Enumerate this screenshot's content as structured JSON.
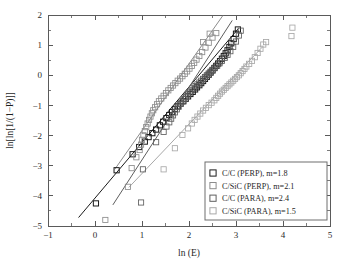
{
  "figure": {
    "background_color": "#ffffff",
    "axis_color": "#5a5a5a"
  },
  "chart_data": {
    "type": "scatter",
    "title": "",
    "xlabel": "ln (E)",
    "ylabel": "ln[ln[1/(1−P)]]",
    "xlim": [
      -1,
      5
    ],
    "ylim": [
      -5,
      2
    ],
    "xticks": [
      -1,
      0,
      1,
      2,
      3,
      4,
      5
    ],
    "xtick_labels": [
      "−1",
      "0",
      "1",
      "2",
      "3",
      "4",
      "5"
    ],
    "yticks": [
      -5,
      -4,
      -3,
      -2,
      -1,
      0,
      1,
      2
    ],
    "ytick_labels": [
      "−5",
      "−4",
      "−3",
      "−2",
      "−1",
      "0",
      "1",
      "2"
    ],
    "xminor_step": 0.5,
    "yminor_step": 0.5,
    "grid": false,
    "legend_position": "lower right",
    "marker_shape": "open-square",
    "series": [
      {
        "name": "C/C (PERP)",
        "legend_label": "C/C (PERP), m=1.8",
        "weibull_modulus": 1.8,
        "color": "#1a1a1a",
        "fit_line": {
          "x": [
            -0.35,
            3.05
          ],
          "y": [
            -4.72,
            1.55
          ],
          "slope": 1.844,
          "intercept": -4.074
        },
        "points": [
          [
            0.02,
            -4.25
          ],
          [
            0.46,
            -3.15
          ],
          [
            0.8,
            -2.62
          ],
          [
            0.94,
            -2.38
          ],
          [
            1.06,
            -2.2
          ],
          [
            1.14,
            -2.05
          ],
          [
            1.22,
            -1.92
          ],
          [
            1.3,
            -1.8
          ],
          [
            1.38,
            -1.66
          ],
          [
            1.45,
            -1.54
          ],
          [
            1.52,
            -1.42
          ],
          [
            1.58,
            -1.32
          ],
          [
            1.64,
            -1.22
          ],
          [
            1.7,
            -1.12
          ],
          [
            1.76,
            -1.03
          ],
          [
            1.82,
            -0.94
          ],
          [
            1.88,
            -0.86
          ],
          [
            1.93,
            -0.78
          ],
          [
            1.98,
            -0.7
          ],
          [
            2.03,
            -0.62
          ],
          [
            2.08,
            -0.55
          ],
          [
            2.13,
            -0.47
          ],
          [
            2.17,
            -0.4
          ],
          [
            2.22,
            -0.33
          ],
          [
            2.26,
            -0.26
          ],
          [
            2.3,
            -0.19
          ],
          [
            2.34,
            -0.12
          ],
          [
            2.38,
            -0.05
          ],
          [
            2.42,
            0.02
          ],
          [
            2.46,
            0.09
          ],
          [
            2.5,
            0.16
          ],
          [
            2.54,
            0.24
          ],
          [
            2.58,
            0.31
          ],
          [
            2.62,
            0.39
          ],
          [
            2.66,
            0.47
          ],
          [
            2.7,
            0.55
          ],
          [
            2.74,
            0.64
          ],
          [
            2.78,
            0.73
          ],
          [
            2.82,
            0.83
          ],
          [
            2.86,
            0.94
          ],
          [
            2.9,
            1.06
          ],
          [
            2.95,
            1.2
          ],
          [
            3.0,
            1.38
          ],
          [
            3.04,
            1.52
          ]
        ]
      },
      {
        "name": "C/SiC (PERP)",
        "legend_label": "C/SiC (PERP), m=2.1",
        "weibull_modulus": 2.1,
        "color": "#8c8c8c",
        "fit_line": {
          "x": [
            0.42,
            2.72
          ],
          "y": [
            -3.12,
            1.98
          ],
          "slope": 2.217,
          "intercept": -4.051
        },
        "points": [
          [
            0.22,
            -4.8
          ],
          [
            0.7,
            -3.7
          ],
          [
            0.78,
            -3.08
          ],
          [
            0.88,
            -2.72
          ],
          [
            0.95,
            -2.48
          ],
          [
            0.98,
            -2.3
          ],
          [
            1.0,
            -2.14
          ],
          [
            1.03,
            -1.99
          ],
          [
            1.06,
            -1.85
          ],
          [
            1.09,
            -1.72
          ],
          [
            1.12,
            -1.6
          ],
          [
            1.15,
            -1.48
          ],
          [
            1.18,
            -1.37
          ],
          [
            1.21,
            -1.26
          ],
          [
            1.24,
            -1.16
          ],
          [
            1.28,
            -1.06
          ],
          [
            1.32,
            -0.96
          ],
          [
            1.36,
            -0.86
          ],
          [
            1.41,
            -0.77
          ],
          [
            1.46,
            -0.68
          ],
          [
            1.51,
            -0.59
          ],
          [
            1.56,
            -0.5
          ],
          [
            1.61,
            -0.42
          ],
          [
            1.66,
            -0.34
          ],
          [
            1.71,
            -0.26
          ],
          [
            1.76,
            -0.18
          ],
          [
            1.81,
            -0.11
          ],
          [
            1.86,
            -0.03
          ],
          [
            1.91,
            0.05
          ],
          [
            1.96,
            0.13
          ],
          [
            2.01,
            0.22
          ],
          [
            2.06,
            0.31
          ],
          [
            2.11,
            0.41
          ],
          [
            2.16,
            0.52
          ],
          [
            2.22,
            0.64
          ],
          [
            2.28,
            0.77
          ],
          [
            2.35,
            0.92
          ],
          [
            2.42,
            1.08
          ],
          [
            2.5,
            1.25
          ],
          [
            2.58,
            1.4
          ],
          [
            2.44,
            1.38
          ],
          [
            2.3,
            1.1
          ]
        ]
      },
      {
        "name": "C/C (PARA)",
        "legend_label": "C/C (PARA), m=2.4",
        "weibull_modulus": 2.4,
        "color": "#5e5e5e",
        "fit_line": {
          "x": [
            0.38,
            2.92
          ],
          "y": [
            -4.3,
            1.82
          ],
          "slope": 2.409,
          "intercept": -5.216
        },
        "points": [
          [
            0.98,
            -4.22
          ],
          [
            1.02,
            -3.12
          ],
          [
            1.3,
            -2.22
          ],
          [
            1.46,
            -1.88
          ],
          [
            1.52,
            -1.7
          ],
          [
            1.58,
            -1.56
          ],
          [
            1.62,
            -1.44
          ],
          [
            1.66,
            -1.33
          ],
          [
            1.7,
            -1.23
          ],
          [
            1.74,
            -1.13
          ],
          [
            1.78,
            -1.04
          ],
          [
            1.82,
            -0.95
          ],
          [
            1.86,
            -0.87
          ],
          [
            1.9,
            -0.79
          ],
          [
            1.94,
            -0.71
          ],
          [
            1.98,
            -0.64
          ],
          [
            2.02,
            -0.57
          ],
          [
            2.06,
            -0.5
          ],
          [
            2.1,
            -0.43
          ],
          [
            2.14,
            -0.36
          ],
          [
            2.18,
            -0.3
          ],
          [
            2.22,
            -0.24
          ],
          [
            2.26,
            -0.18
          ],
          [
            2.3,
            -0.12
          ],
          [
            2.34,
            -0.06
          ],
          [
            2.38,
            0.0
          ],
          [
            2.42,
            0.06
          ],
          [
            2.46,
            0.12
          ],
          [
            2.5,
            0.18
          ],
          [
            2.55,
            0.25
          ],
          [
            2.6,
            0.32
          ],
          [
            2.65,
            0.4
          ],
          [
            2.7,
            0.48
          ],
          [
            2.76,
            0.58
          ],
          [
            2.82,
            0.68
          ],
          [
            2.88,
            0.8
          ],
          [
            2.94,
            0.94
          ],
          [
            3.0,
            1.12
          ],
          [
            3.06,
            1.32
          ],
          [
            3.1,
            1.48
          ]
        ]
      },
      {
        "name": "C/SiC (PARA)",
        "legend_label": "C/SiC (PARA), m=1.5",
        "weibull_modulus": 1.5,
        "color": "#a8a8a8",
        "fit_line": {
          "x": [
            0.72,
            3.55
          ],
          "y": [
            -3.72,
            0.92
          ],
          "slope": 1.64,
          "intercept": -4.901
        },
        "points": [
          [
            1.46,
            -3.12
          ],
          [
            1.7,
            -2.42
          ],
          [
            1.86,
            -1.98
          ],
          [
            1.98,
            -1.76
          ],
          [
            2.06,
            -1.6
          ],
          [
            2.12,
            -1.48
          ],
          [
            2.18,
            -1.37
          ],
          [
            2.24,
            -1.27
          ],
          [
            2.3,
            -1.17
          ],
          [
            2.36,
            -1.08
          ],
          [
            2.42,
            -0.99
          ],
          [
            2.48,
            -0.91
          ],
          [
            2.54,
            -0.83
          ],
          [
            2.58,
            -0.75
          ],
          [
            2.62,
            -0.68
          ],
          [
            2.66,
            -0.61
          ],
          [
            2.7,
            -0.54
          ],
          [
            2.74,
            -0.48
          ],
          [
            2.78,
            -0.42
          ],
          [
            2.82,
            -0.36
          ],
          [
            2.86,
            -0.3
          ],
          [
            2.9,
            -0.24
          ],
          [
            2.94,
            -0.18
          ],
          [
            2.98,
            -0.12
          ],
          [
            3.02,
            -0.06
          ],
          [
            3.06,
            0.0
          ],
          [
            3.1,
            0.07
          ],
          [
            3.14,
            0.14
          ],
          [
            3.18,
            0.21
          ],
          [
            3.22,
            0.29
          ],
          [
            3.28,
            0.38
          ],
          [
            3.34,
            0.48
          ],
          [
            3.4,
            0.6
          ],
          [
            3.46,
            0.74
          ],
          [
            3.52,
            0.88
          ],
          [
            3.58,
            1.02
          ],
          [
            3.64,
            1.1
          ],
          [
            4.18,
            1.3
          ],
          [
            4.2,
            1.58
          ]
        ]
      }
    ]
  }
}
